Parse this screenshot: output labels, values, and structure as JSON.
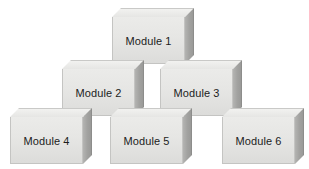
{
  "diagram": {
    "background_color": "#ffffff",
    "block_front_color": "#e6e6e4",
    "block_top_color": "#f2f2f0",
    "block_side_color": "#a2a2a0",
    "block_edge_color": "#c4c4c2",
    "label_color": "#1c1c1c",
    "rows": [
      {
        "name": "top-row",
        "blocks": [
          {
            "label": "Module 1",
            "x": 112,
            "y": 8,
            "w": 73,
            "h": 47,
            "depth": 9
          }
        ]
      },
      {
        "name": "middle-row",
        "blocks": [
          {
            "label": "Module 2",
            "x": 62,
            "y": 60,
            "w": 73,
            "h": 47,
            "depth": 9
          },
          {
            "label": "Module 3",
            "x": 160,
            "y": 60,
            "w": 73,
            "h": 47,
            "depth": 9
          }
        ]
      },
      {
        "name": "bottom-row",
        "blocks": [
          {
            "label": "Module 4",
            "x": 10,
            "y": 108,
            "w": 73,
            "h": 47,
            "depth": 9
          },
          {
            "label": "Module 5",
            "x": 110,
            "y": 108,
            "w": 73,
            "h": 47,
            "depth": 9
          },
          {
            "label": "Module 6",
            "x": 222,
            "y": 108,
            "w": 73,
            "h": 47,
            "depth": 9
          }
        ]
      }
    ]
  }
}
